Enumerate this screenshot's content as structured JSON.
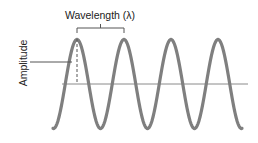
{
  "diagram": {
    "title_label": "Wavelength (λ)",
    "amplitude_label": "Amplitude",
    "wave": {
      "cycles": 4,
      "color": "#7f7f7f",
      "stroke_width": 3.2
    },
    "baseline_color": "#8a8a8a",
    "annotation_color": "#555555",
    "text_color": "#222222"
  }
}
